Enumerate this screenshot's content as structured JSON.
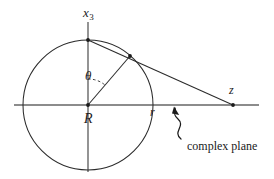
{
  "figure": {
    "type": "geometric-diagram",
    "background_color": "#ffffff",
    "stroke_color": "#1a1a1a",
    "axis_color": "#555555",
    "labels": {
      "vertical_axis": "x",
      "vertical_axis_subscript": "3",
      "angle": "θ",
      "radius_label": "R",
      "projected_radius_label": "r",
      "point_label": "z",
      "annotation": "complex plane"
    },
    "geometry": {
      "center": {
        "x": 88,
        "y": 105
      },
      "circle_radius": 65,
      "north_pole": {
        "x": 88,
        "y": 40
      },
      "surface_point": {
        "x": 130,
        "y": 56
      },
      "z_point": {
        "x": 233,
        "y": 105
      },
      "horizontal_axis": {
        "x1": 14,
        "x2": 259,
        "y": 105
      },
      "vertical_axis": {
        "x": 88,
        "y1": 22,
        "y2": 172
      },
      "theta_arc_radius": 26
    }
  }
}
